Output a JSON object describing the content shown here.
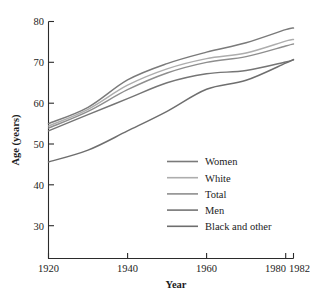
{
  "chart_data": {
    "type": "line",
    "title": "",
    "xlabel": "Year",
    "ylabel": "Age (years)",
    "xlim": [
      1920,
      1982
    ],
    "ylim": [
      22,
      80
    ],
    "grid": false,
    "legend_position": "center",
    "xticks": [
      1920,
      1940,
      1960,
      1980,
      1982
    ],
    "xtick_labels": [
      "1920",
      "1940",
      "1960",
      "1980",
      "1982"
    ],
    "yticks": [
      30,
      40,
      50,
      60,
      70,
      80
    ],
    "ytick_labels": [
      "30",
      "40",
      "50",
      "60",
      "70",
      "80"
    ],
    "x": [
      1920,
      1930,
      1940,
      1950,
      1960,
      1970,
      1980,
      1982
    ],
    "series": [
      {
        "name": "Women",
        "color": "#7a7a7a",
        "values": [
          55.0,
          59.0,
          65.7,
          69.7,
          72.5,
          74.8,
          78.0,
          78.4
        ]
      },
      {
        "name": "White",
        "color": "#adadad",
        "values": [
          54.4,
          58.5,
          64.4,
          68.4,
          70.9,
          72.3,
          75.2,
          75.6
        ]
      },
      {
        "name": "Total",
        "color": "#8e8e8e",
        "values": [
          53.9,
          58.0,
          63.3,
          67.4,
          70.0,
          71.4,
          74.0,
          74.5
        ]
      },
      {
        "name": "Men",
        "color": "#757575",
        "values": [
          53.2,
          57.2,
          61.1,
          65.0,
          67.2,
          68.0,
          70.1,
          70.6
        ]
      },
      {
        "name": "Black and other",
        "color": "#6e6e6e",
        "values": [
          45.6,
          48.5,
          53.2,
          58.0,
          63.4,
          65.6,
          69.8,
          70.7
        ]
      }
    ]
  },
  "axes": {
    "y_label": "Age (years)",
    "x_label": "Year"
  },
  "legend": {
    "items": [
      {
        "label": "Women"
      },
      {
        "label": "White"
      },
      {
        "label": "Total"
      },
      {
        "label": "Men"
      },
      {
        "label": "Black and other"
      }
    ]
  }
}
